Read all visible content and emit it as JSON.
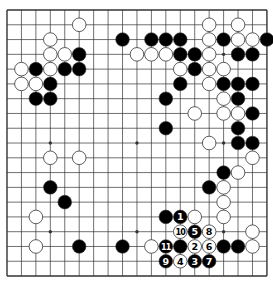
{
  "board": {
    "size": 19,
    "origin": {
      "x": 7,
      "y": 10
    },
    "spacing": {
      "x": 14.44,
      "y": 14.78
    },
    "stone_radius": 6.8,
    "colors": {
      "line": "#333333",
      "black": "#000000",
      "white": "#ffffff",
      "stone_edge": "#333333",
      "background": "#ffffff"
    },
    "star_points": [
      [
        3,
        3
      ],
      [
        9,
        3
      ],
      [
        15,
        3
      ],
      [
        3,
        9
      ],
      [
        9,
        9
      ],
      [
        15,
        9
      ],
      [
        3,
        15
      ],
      [
        9,
        15
      ],
      [
        15,
        15
      ]
    ],
    "stones": [
      {
        "c": 5,
        "r": 1,
        "color": "white"
      },
      {
        "c": 14,
        "r": 1,
        "color": "white"
      },
      {
        "c": 16,
        "r": 1,
        "color": "white"
      },
      {
        "c": 3,
        "r": 2,
        "color": "white"
      },
      {
        "c": 8,
        "r": 2,
        "color": "black"
      },
      {
        "c": 10,
        "r": 2,
        "color": "black"
      },
      {
        "c": 11,
        "r": 2,
        "color": "black"
      },
      {
        "c": 12,
        "r": 2,
        "color": "black"
      },
      {
        "c": 14,
        "r": 2,
        "color": "white"
      },
      {
        "c": 15,
        "r": 2,
        "color": "black"
      },
      {
        "c": 16,
        "r": 2,
        "color": "white"
      },
      {
        "c": 17,
        "r": 2,
        "color": "white"
      },
      {
        "c": 18,
        "r": 2,
        "color": "black"
      },
      {
        "c": 3,
        "r": 3,
        "color": "white"
      },
      {
        "c": 4,
        "r": 3,
        "color": "white"
      },
      {
        "c": 5,
        "r": 3,
        "color": "black"
      },
      {
        "c": 9,
        "r": 3,
        "color": "white"
      },
      {
        "c": 10,
        "r": 3,
        "color": "white"
      },
      {
        "c": 11,
        "r": 3,
        "color": "white"
      },
      {
        "c": 12,
        "r": 3,
        "color": "black"
      },
      {
        "c": 13,
        "r": 3,
        "color": "black"
      },
      {
        "c": 14,
        "r": 3,
        "color": "white"
      },
      {
        "c": 16,
        "r": 3,
        "color": "black"
      },
      {
        "c": 17,
        "r": 3,
        "color": "black"
      },
      {
        "c": 1,
        "r": 4,
        "color": "white"
      },
      {
        "c": 2,
        "r": 4,
        "color": "black"
      },
      {
        "c": 3,
        "r": 4,
        "color": "white"
      },
      {
        "c": 4,
        "r": 4,
        "color": "black"
      },
      {
        "c": 5,
        "r": 4,
        "color": "black"
      },
      {
        "c": 12,
        "r": 4,
        "color": "white"
      },
      {
        "c": 13,
        "r": 4,
        "color": "black"
      },
      {
        "c": 14,
        "r": 4,
        "color": "white"
      },
      {
        "c": 15,
        "r": 4,
        "color": "white"
      },
      {
        "c": 1,
        "r": 5,
        "color": "white"
      },
      {
        "c": 2,
        "r": 5,
        "color": "white"
      },
      {
        "c": 3,
        "r": 5,
        "color": "black"
      },
      {
        "c": 12,
        "r": 5,
        "color": "black"
      },
      {
        "c": 14,
        "r": 5,
        "color": "white"
      },
      {
        "c": 15,
        "r": 5,
        "color": "black"
      },
      {
        "c": 16,
        "r": 5,
        "color": "black"
      },
      {
        "c": 17,
        "r": 5,
        "color": "black"
      },
      {
        "c": 2,
        "r": 6,
        "color": "black"
      },
      {
        "c": 3,
        "r": 6,
        "color": "black"
      },
      {
        "c": 11,
        "r": 6,
        "color": "black"
      },
      {
        "c": 15,
        "r": 6,
        "color": "white"
      },
      {
        "c": 16,
        "r": 6,
        "color": "black"
      },
      {
        "c": 13,
        "r": 7,
        "color": "white"
      },
      {
        "c": 15,
        "r": 7,
        "color": "white"
      },
      {
        "c": 16,
        "r": 7,
        "color": "white"
      },
      {
        "c": 17,
        "r": 7,
        "color": "black"
      },
      {
        "c": 11,
        "r": 8,
        "color": "black"
      },
      {
        "c": 16,
        "r": 8,
        "color": "black"
      },
      {
        "c": 14,
        "r": 9,
        "color": "white"
      },
      {
        "c": 16,
        "r": 9,
        "color": "black"
      },
      {
        "c": 17,
        "r": 9,
        "color": "black"
      },
      {
        "c": 3,
        "r": 10,
        "color": "white"
      },
      {
        "c": 5,
        "r": 10,
        "color": "white"
      },
      {
        "c": 17,
        "r": 10,
        "color": "white"
      },
      {
        "c": 15,
        "r": 11,
        "color": "black"
      },
      {
        "c": 16,
        "r": 11,
        "color": "white"
      },
      {
        "c": 3,
        "r": 12,
        "color": "black"
      },
      {
        "c": 14,
        "r": 12,
        "color": "black"
      },
      {
        "c": 15,
        "r": 12,
        "color": "white"
      },
      {
        "c": 4,
        "r": 13,
        "color": "black"
      },
      {
        "c": 15,
        "r": 13,
        "color": "white"
      },
      {
        "c": 2,
        "r": 14,
        "color": "white"
      },
      {
        "c": 11,
        "r": 14,
        "color": "black"
      },
      {
        "c": 12,
        "r": 14,
        "color": "black",
        "label": "1"
      },
      {
        "c": 13,
        "r": 14,
        "color": "white"
      },
      {
        "c": 15,
        "r": 14,
        "color": "white"
      },
      {
        "c": 12,
        "r": 15,
        "color": "white",
        "label": "10"
      },
      {
        "c": 13,
        "r": 15,
        "color": "black",
        "label": "5"
      },
      {
        "c": 14,
        "r": 15,
        "color": "white",
        "label": "8"
      },
      {
        "c": 17,
        "r": 15,
        "color": "white"
      },
      {
        "c": 2,
        "r": 16,
        "color": "white"
      },
      {
        "c": 5,
        "r": 16,
        "color": "black"
      },
      {
        "c": 8,
        "r": 16,
        "color": "black"
      },
      {
        "c": 10,
        "r": 16,
        "color": "white"
      },
      {
        "c": 11,
        "r": 16,
        "color": "black",
        "label": "11"
      },
      {
        "c": 12,
        "r": 16,
        "color": "black"
      },
      {
        "c": 13,
        "r": 16,
        "color": "white",
        "label": "2"
      },
      {
        "c": 14,
        "r": 16,
        "color": "white",
        "label": "6"
      },
      {
        "c": 15,
        "r": 16,
        "color": "black"
      },
      {
        "c": 16,
        "r": 16,
        "color": "black"
      },
      {
        "c": 17,
        "r": 16,
        "color": "white"
      },
      {
        "c": 11,
        "r": 17,
        "color": "black",
        "label": "9"
      },
      {
        "c": 12,
        "r": 17,
        "color": "white",
        "label": "4"
      },
      {
        "c": 13,
        "r": 17,
        "color": "black",
        "label": "3"
      },
      {
        "c": 14,
        "r": 17,
        "color": "black",
        "label": "7"
      }
    ]
  }
}
